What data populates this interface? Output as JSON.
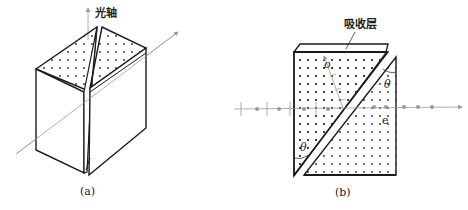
{
  "figure_a": {
    "caption": "(a)",
    "optic_axis_label": "光轴"
  },
  "figure_b": {
    "caption": "(b)",
    "absorber_label": "吸收层",
    "o_ray_label": "o",
    "e_ray_label": "e",
    "angle_top_label": "θ",
    "angle_bottom_label": "θ"
  },
  "colors": {
    "stroke": "#1a1a1a",
    "ray": "#9a9a9a",
    "dot": "#2a2a2a"
  }
}
